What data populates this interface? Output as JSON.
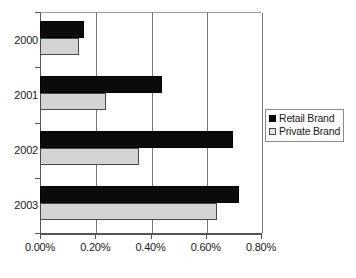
{
  "chart_data": {
    "type": "bar",
    "orientation": "horizontal",
    "title": "",
    "xlabel": "",
    "ylabel": "",
    "categories": [
      "2000",
      "2001",
      "2002",
      "2003"
    ],
    "series": [
      {
        "name": "Retail Brand",
        "color": "#0b0b0b",
        "values": [
          0.16,
          0.44,
          0.7,
          0.72
        ]
      },
      {
        "name": "Private Brand",
        "color": "#d4d4d4",
        "values": [
          0.14,
          0.24,
          0.36,
          0.64
        ]
      }
    ],
    "xlim": [
      0.0,
      0.8
    ],
    "xticks": [
      0.0,
      0.2,
      0.4,
      0.6,
      0.8
    ],
    "xtick_labels": [
      "0.00%",
      "0.20%",
      "0.40%",
      "0.60%",
      "0.80%"
    ],
    "value_format": "percent",
    "grid": "vertical",
    "legend_position": "right"
  },
  "legend": {
    "entries": [
      {
        "label": "Retail Brand"
      },
      {
        "label": "Private Brand"
      }
    ]
  }
}
